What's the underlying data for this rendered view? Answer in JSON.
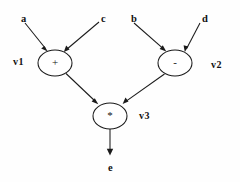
{
  "diagram": {
    "type": "directed-acyclic-graph",
    "background_color": "#fefefe",
    "stroke_color": "#1a1a1a",
    "text_color": "#111111",
    "inputs": [
      {
        "id": "a",
        "label": "a",
        "x": 21,
        "y": 14
      },
      {
        "id": "c",
        "label": "c",
        "x": 101,
        "y": 14
      },
      {
        "id": "b",
        "label": "b",
        "x": 131,
        "y": 14
      },
      {
        "id": "d",
        "label": "d",
        "x": 202,
        "y": 14
      }
    ],
    "outputs": [
      {
        "id": "e",
        "label": "e",
        "x": 108,
        "y": 163
      }
    ],
    "nodes": [
      {
        "id": "v1",
        "operator": "+",
        "name": "v1",
        "cx": 55,
        "cy": 63,
        "rx": 17,
        "ry": 13,
        "name_x": 13,
        "name_y": 57,
        "name_side": "left"
      },
      {
        "id": "v2",
        "operator": "-",
        "name": "v2",
        "cx": 175,
        "cy": 63,
        "rx": 17,
        "ry": 13,
        "name_x": 211,
        "name_y": 60,
        "name_side": "right"
      },
      {
        "id": "v3",
        "operator": "*",
        "name": "v3",
        "cx": 110,
        "cy": 116,
        "rx": 17,
        "ry": 13,
        "name_x": 139,
        "name_y": 111,
        "name_side": "right"
      }
    ],
    "edges": [
      {
        "from": "a",
        "to": "v1",
        "label": ""
      },
      {
        "from": "c",
        "to": "v1",
        "label": ""
      },
      {
        "from": "b",
        "to": "v2",
        "label": ""
      },
      {
        "from": "d",
        "to": "v2",
        "label": ""
      },
      {
        "from": "v1",
        "to": "v3",
        "label": ""
      },
      {
        "from": "v2",
        "to": "v3",
        "label": ""
      },
      {
        "from": "v3",
        "to": "e",
        "label": ""
      }
    ]
  }
}
